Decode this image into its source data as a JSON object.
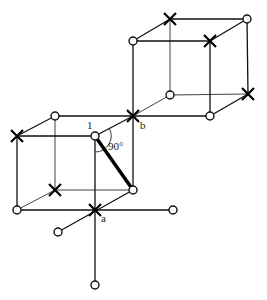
{
  "diagram": {
    "labels": {
      "site1": "1",
      "siteA": "a",
      "siteB": "b",
      "angle": "90°"
    },
    "colors": {
      "line": "#111111",
      "background": "#ffffff"
    },
    "nodes": [
      {
        "id": "u_ftl",
        "x": 133,
        "y": 41,
        "type": "circle"
      },
      {
        "id": "u_btl",
        "x": 170,
        "y": 19,
        "type": "cross"
      },
      {
        "id": "u_btr",
        "x": 247,
        "y": 19,
        "type": "circle"
      },
      {
        "id": "u_ftr",
        "x": 210,
        "y": 41,
        "type": "cross"
      },
      {
        "id": "u_bbl",
        "x": 170,
        "y": 95,
        "type": "circle"
      },
      {
        "id": "u_bbr",
        "x": 248,
        "y": 94,
        "type": "cross"
      },
      {
        "id": "u_fbr",
        "x": 210,
        "y": 116,
        "type": "circle"
      },
      {
        "id": "b",
        "x": 133,
        "y": 116,
        "type": "cross"
      },
      {
        "id": "l_btl",
        "x": 55,
        "y": 116,
        "type": "circle"
      },
      {
        "id": "l_ftl",
        "x": 17,
        "y": 136,
        "type": "cross"
      },
      {
        "id": "site1",
        "x": 95,
        "y": 136,
        "type": "circle"
      },
      {
        "id": "l_fbl",
        "x": 17,
        "y": 210,
        "type": "circle"
      },
      {
        "id": "l_bbl",
        "x": 55,
        "y": 190,
        "type": "cross"
      },
      {
        "id": "l_bbr",
        "x": 133,
        "y": 190,
        "type": "circle"
      },
      {
        "id": "a",
        "x": 95,
        "y": 210,
        "type": "cross"
      },
      {
        "id": "ext_left",
        "x": 58,
        "y": 232,
        "type": "circle"
      },
      {
        "id": "ext_right",
        "x": 173,
        "y": 210,
        "type": "circle"
      },
      {
        "id": "ext_down",
        "x": 95,
        "y": 285,
        "type": "circle"
      }
    ]
  }
}
